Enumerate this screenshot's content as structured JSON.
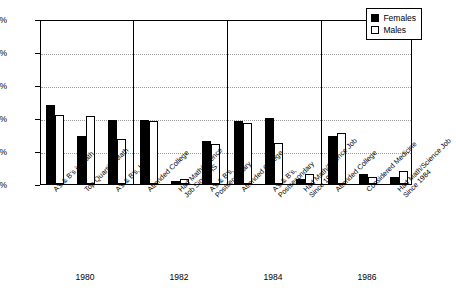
{
  "chart_data": {
    "type": "bar",
    "title": "",
    "subtitle": "",
    "xlabel": "",
    "ylabel": "",
    "ylim": [
      0,
      100
    ],
    "yticks": [
      "0%",
      "20%",
      "40%",
      "60%",
      "80%",
      "100%"
    ],
    "ytick_values": [
      0,
      20,
      40,
      60,
      80,
      100
    ],
    "grid": true,
    "legend_position": "top-right",
    "legend": [
      {
        "name": "Females",
        "color": "#000000",
        "style": "filled"
      },
      {
        "name": "Males",
        "color": "#ffffff",
        "style": "outlined"
      }
    ],
    "groups": [
      "1980",
      "1982",
      "1984",
      "1986"
    ],
    "categories": [
      "A's & B's in Math",
      "Top Quartile, Math",
      "A's & B's, HS",
      "Attended College",
      "Had Math/Science\nJob Since HS",
      "A's & B's,\nPostsecondary",
      "Attended College",
      "A's & B's,\nPostsecondary",
      "Had Math/Science Job\nSince 1982",
      "Attended College",
      "Considered Medicine",
      "Had Math/Science Job\nSince 1984"
    ],
    "series": [
      {
        "name": "Females",
        "values": [
          48,
          29,
          39,
          39,
          2,
          26,
          38,
          40,
          3,
          29,
          6,
          4
        ]
      },
      {
        "name": "Males",
        "values": [
          42,
          41,
          27,
          38,
          3,
          24,
          37,
          25,
          6,
          31,
          4,
          8
        ]
      }
    ],
    "group_spans": [
      {
        "group": "1980",
        "start": 0,
        "end": 2
      },
      {
        "group": "1982",
        "start": 3,
        "end": 5
      },
      {
        "group": "1984",
        "start": 6,
        "end": 8
      },
      {
        "group": "1986",
        "start": 9,
        "end": 11
      }
    ]
  }
}
